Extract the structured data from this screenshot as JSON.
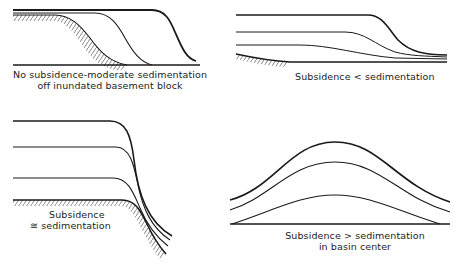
{
  "panels": [
    {
      "id": "top-left",
      "caption_line1": "No subsidence-moderate sedimentation",
      "caption_line2": "off inundated basement block",
      "layers": 3,
      "basement": "hatched block, slope down to basin floor"
    },
    {
      "id": "top-right",
      "caption_line1": "Subsidence < sedimentation",
      "layers": 4,
      "basement": "hatched, gentle slope"
    },
    {
      "id": "bottom-left",
      "caption_symbol": "≅",
      "caption_line1": "Subsidence",
      "caption_line2": "sedimentation",
      "layers": 4,
      "basement": "hatched flat block, steep margin"
    },
    {
      "id": "bottom-right",
      "caption_line1": "Subsidence > sedimentation",
      "caption_line2": "in basin center",
      "layers": 4,
      "basement": "flat baseline"
    }
  ],
  "colors": {
    "line": "#1a1a1a",
    "hatch": "#555555",
    "background": "#ffffff"
  }
}
